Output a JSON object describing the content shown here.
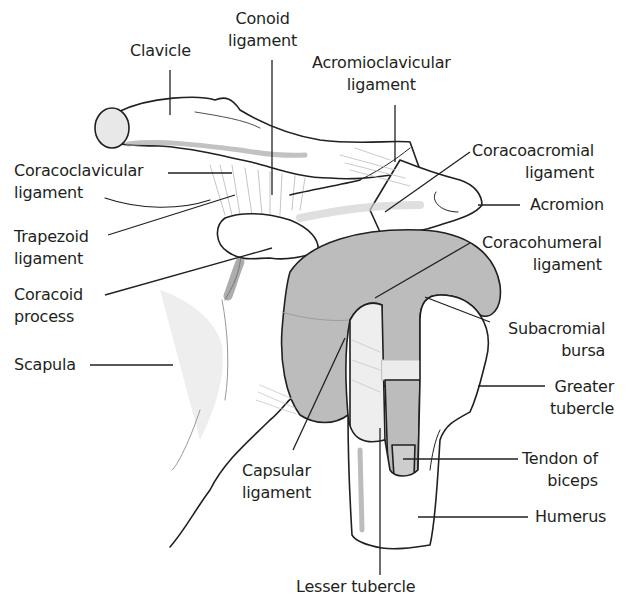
{
  "diagram": {
    "colors": {
      "outline": "#231f20",
      "bursa_fill": "#b9b9b9",
      "bone_fill": "#ffffff",
      "shadow": "#8a8a8a",
      "ligament_fill": "#e6e6e6",
      "leader_line": "#231f20"
    },
    "labels": {
      "clavicle": "Clavicle",
      "conoid_ligament": "Conoid\nligament",
      "acromioclavicular_ligament": "Acromioclavicular\nligament",
      "coracoacromial_ligament": "Coracoacromial\nligament",
      "coracoclavicular_ligament": "Coracoclavicular\nligament",
      "acromion": "Acromion",
      "trapezoid_ligament": "Trapezoid\nligament",
      "coracohumeral_ligament": "Coracohumeral\nligament",
      "coracoid_process": "Coracoid\nprocess",
      "subacromial_bursa": "Subacromial\nbursa",
      "scapula": "Scapula",
      "greater_tubercle": "Greater\ntubercle",
      "capsular_ligament": "Capsular\nligament",
      "tendon_of_biceps": "Tendon of\nbiceps",
      "humerus": "Humerus",
      "lesser_tubercle": "Lesser tubercle"
    }
  }
}
